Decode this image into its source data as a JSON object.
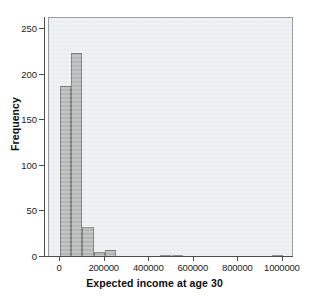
{
  "chart_data": {
    "type": "bar",
    "title": "",
    "subtitle": "",
    "xlabel": "Expected income at age 30",
    "ylabel": "Frequency",
    "xlim": [
      -50000,
      1050000
    ],
    "ylim": [
      0,
      262
    ],
    "xticks": [
      0,
      200000,
      400000,
      600000,
      800000,
      1000000
    ],
    "xticklabels": [
      "0",
      "200000",
      "400000",
      "600000",
      "800000",
      "1000000"
    ],
    "yticks": [
      0,
      50,
      100,
      150,
      200,
      250
    ],
    "yticklabels": [
      "0",
      "50",
      "100",
      "150",
      "200",
      "250"
    ],
    "grid": false,
    "legend": false,
    "bin_width": 50000,
    "bar_color": "#b0b2b1",
    "bar_edge_color": "#6e7170",
    "panel_background": "#eceff0",
    "bins": [
      {
        "bin_start": 0,
        "bin_end": 50000,
        "value": 188
      },
      {
        "bin_start": 50000,
        "bin_end": 100000,
        "value": 224
      },
      {
        "bin_start": 100000,
        "bin_end": 150000,
        "value": 33
      },
      {
        "bin_start": 150000,
        "bin_end": 200000,
        "value": 5
      },
      {
        "bin_start": 200000,
        "bin_end": 250000,
        "value": 8
      },
      {
        "bin_start": 250000,
        "bin_end": 300000,
        "value": 0
      },
      {
        "bin_start": 300000,
        "bin_end": 350000,
        "value": 0
      },
      {
        "bin_start": 350000,
        "bin_end": 400000,
        "value": 0
      },
      {
        "bin_start": 400000,
        "bin_end": 450000,
        "value": 0
      },
      {
        "bin_start": 450000,
        "bin_end": 500000,
        "value": 2
      },
      {
        "bin_start": 500000,
        "bin_end": 550000,
        "value": 1
      },
      {
        "bin_start": 550000,
        "bin_end": 600000,
        "value": 0
      },
      {
        "bin_start": 600000,
        "bin_end": 650000,
        "value": 0
      },
      {
        "bin_start": 650000,
        "bin_end": 700000,
        "value": 0
      },
      {
        "bin_start": 700000,
        "bin_end": 750000,
        "value": 0
      },
      {
        "bin_start": 750000,
        "bin_end": 800000,
        "value": 0
      },
      {
        "bin_start": 800000,
        "bin_end": 850000,
        "value": 0
      },
      {
        "bin_start": 850000,
        "bin_end": 900000,
        "value": 0
      },
      {
        "bin_start": 900000,
        "bin_end": 950000,
        "value": 0
      },
      {
        "bin_start": 950000,
        "bin_end": 1000000,
        "value": 2
      }
    ]
  }
}
